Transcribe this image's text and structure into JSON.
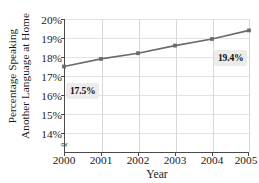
{
  "chart_data": {
    "type": "line",
    "title": "",
    "xlabel": "Year",
    "ylabel": "Percentage Speaking Another Language at Home",
    "ylabel_line1": "Percentage Speaking",
    "ylabel_line2": "Another Language at Home",
    "x": [
      2000,
      2001,
      2002,
      2003,
      2004,
      2005
    ],
    "xtick_labels": [
      "2000",
      "2001",
      "2002",
      "2003",
      "2004",
      "2005"
    ],
    "values": [
      17.5,
      17.9,
      18.2,
      18.6,
      18.95,
      19.4
    ],
    "ytick_labels": [
      "20%",
      "19%",
      "18%",
      "17%",
      "16%",
      "15%",
      "14%"
    ],
    "ytick_values": [
      20,
      19,
      18,
      17,
      16,
      15,
      14
    ],
    "ylim": [
      13.4,
      20
    ],
    "xlim": [
      2000,
      2005
    ],
    "grid": true,
    "legend": "none",
    "series_color": "#6b6b6b",
    "marker": "square",
    "annotations": [
      {
        "id": "start",
        "label": "17.5%",
        "x": 2000,
        "y": 17.5
      },
      {
        "id": "end",
        "label": "19.4%",
        "x": 2005,
        "y": 19.4
      }
    ],
    "axis_break": true,
    "axis_break_glyph": "≃"
  },
  "colors": {
    "series": "#6b6b6b",
    "axis": "#4a4a4a",
    "gridline": "#d8d8d8",
    "callout_bg": "#ececec",
    "text": "#1a1a1a"
  }
}
